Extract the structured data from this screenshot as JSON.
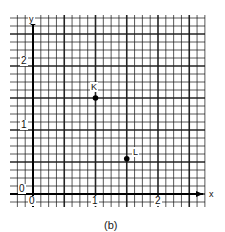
{
  "chart_data": {
    "type": "scatter",
    "title": "",
    "caption": "(b)",
    "xlabel": "x",
    "ylabel": "y",
    "xlim": [
      -0.35,
      2.75
    ],
    "ylim": [
      -0.1,
      2.8
    ],
    "grid": true,
    "grid_minor_per_unit": 8,
    "x_ticks": [
      "0",
      "1",
      "2"
    ],
    "y_ticks": [
      "0",
      "1",
      "2"
    ],
    "points": [
      {
        "label": "K",
        "x": 1.0,
        "y": 1.5
      },
      {
        "label": "L",
        "x": 1.5,
        "y": 0.55
      }
    ],
    "colors": {
      "grid": "#1a1a1a",
      "background": "#ffffff"
    }
  },
  "labels": {
    "x_axis": "x",
    "y_axis": "y",
    "x_tick_0": "0",
    "x_tick_1": "1",
    "x_tick_2": "2",
    "y_tick_0": "0",
    "y_tick_1": "1",
    "y_tick_2": "2",
    "point_k": "K",
    "point_l": "L",
    "caption": "(b)"
  }
}
